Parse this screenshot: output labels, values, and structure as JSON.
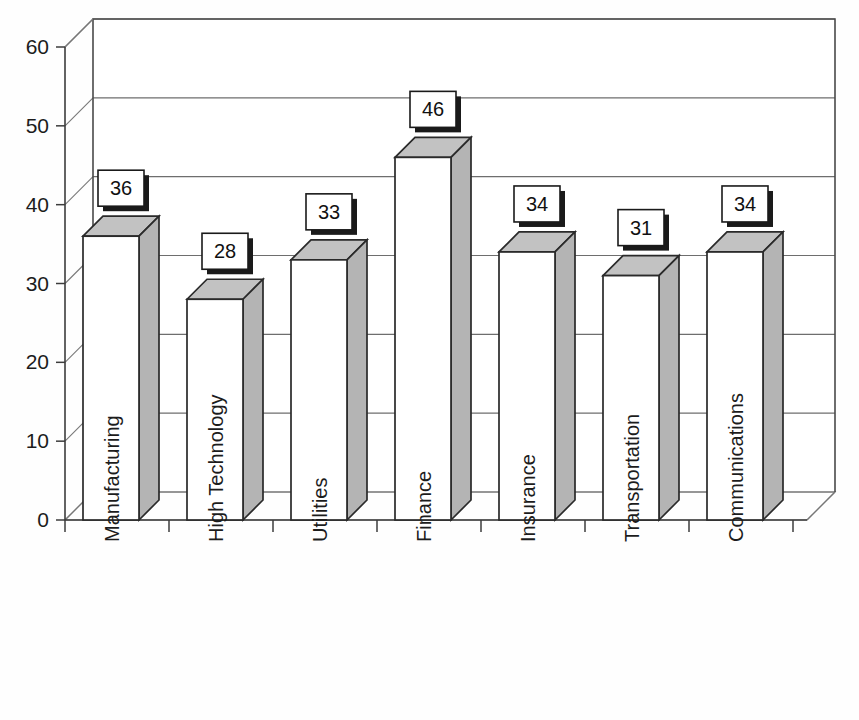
{
  "chart_data": {
    "type": "bar",
    "title": "",
    "subtitle": "",
    "xlabel": "",
    "ylabel": "",
    "categories": [
      "Manufacturing",
      "High Technology",
      "Utilities",
      "Finance",
      "Insurance",
      "Transportation",
      "Communications"
    ],
    "values": [
      36,
      28,
      33,
      46,
      34,
      31,
      34
    ],
    "data_labels": [
      "36",
      "28",
      "33",
      "46",
      "34",
      "31",
      "34"
    ],
    "ylim": [
      0,
      60
    ],
    "y_ticks": [
      0,
      10,
      20,
      30,
      40,
      50,
      60
    ],
    "y_tick_labels": [
      "0",
      "10",
      "20",
      "30",
      "40",
      "50",
      "60"
    ],
    "grid": true,
    "grid_axis": "y",
    "legend": false,
    "legend_position": "none",
    "three_d": true,
    "label_rotation_deg": 90,
    "series": [
      {
        "name": "Series 1",
        "values": [
          36,
          28,
          33,
          46,
          34,
          31,
          34
        ]
      }
    ]
  },
  "style": {
    "bar_front_color": "#ffffff",
    "bar_side_color": "#b4b4b4",
    "bar_top_color": "#c2c2c2",
    "bar_outline_color": "#2a2a2a",
    "grid_color": "#6e6e6e",
    "axis_color": "#3c3c3c",
    "frame_color": "#4a4a4a",
    "label_box_fill": "#ffffff",
    "label_box_border": "#1a1a1a",
    "label_shadow_color": "#1a1a1a",
    "text_color": "#1c1c1c",
    "background_color": "#ffffff"
  },
  "geometry": {
    "plot_left": 65,
    "plot_right": 807,
    "plot_baseline_y": 520,
    "plot_top_y": 47,
    "depth_dx": 28,
    "depth_dy": 28,
    "bar_front_width": 56,
    "bar_depth_dx": 20,
    "bar_depth_dy": 20,
    "category_slot_width": 104,
    "first_slot_left": 65
  }
}
